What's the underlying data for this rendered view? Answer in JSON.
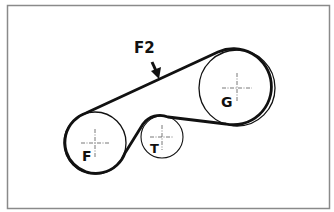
{
  "diagram": {
    "pulleys": [
      {
        "id": "F",
        "label": "F",
        "role": "drive pulley"
      },
      {
        "id": "T",
        "label": "T",
        "role": "tensioner / idler"
      },
      {
        "id": "G",
        "label": "G",
        "role": "driven pulley"
      }
    ],
    "belt": {
      "label": "belt"
    },
    "annotation": {
      "label": "F2",
      "icon": "arrow-down-icon",
      "target": "upper belt span between F and G"
    },
    "colors": {
      "line": "#111111",
      "frame": "#8a8a8a",
      "background": "#ffffff",
      "crosshair": "#555555"
    }
  }
}
